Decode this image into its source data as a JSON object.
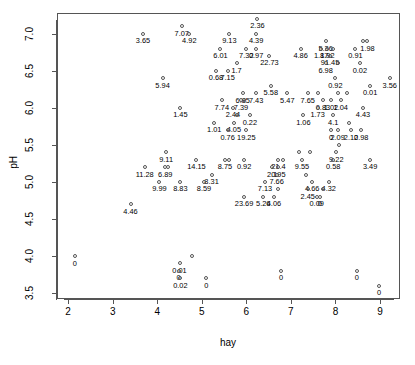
{
  "chart_data": {
    "type": "scatter",
    "title": "",
    "xlabel": "hay",
    "ylabel": "pH",
    "xlim": [
      1.75,
      9.45
    ],
    "ylim": [
      3.42,
      7.28
    ],
    "xticks": [
      "2",
      "3",
      "4",
      "5",
      "6",
      "7",
      "8",
      "9"
    ],
    "xtick_values": [
      2,
      3,
      4,
      5,
      6,
      7,
      8,
      9
    ],
    "yticks": [
      "3.5",
      "4.0",
      "4.5",
      "5.0",
      "5.5",
      "6.0",
      "6.5",
      "7.0"
    ],
    "ytick_values": [
      3.5,
      4.0,
      4.5,
      5.0,
      5.5,
      6.0,
      6.5,
      7.0
    ],
    "grid": false,
    "legend": null,
    "point_marker": "open-circle",
    "label_position": "below-point",
    "points": [
      {
        "x": 6.25,
        "y": 7.2,
        "label": "2.36"
      },
      {
        "x": 4.55,
        "y": 7.1,
        "label": "7.07"
      },
      {
        "x": 3.68,
        "y": 7.0,
        "label": "3.65"
      },
      {
        "x": 4.72,
        "y": 7.0,
        "label": "4.92"
      },
      {
        "x": 5.62,
        "y": 7.0,
        "label": "9.13"
      },
      {
        "x": 6.22,
        "y": 7.0,
        "label": "4.39"
      },
      {
        "x": 7.78,
        "y": 6.9,
        "label": "5.36"
      },
      {
        "x": 8.72,
        "y": 6.9,
        "label": "1.98"
      },
      {
        "x": 8.62,
        "y": 6.9,
        "label": ""
      },
      {
        "x": 5.42,
        "y": 6.8,
        "label": "6.01"
      },
      {
        "x": 6.0,
        "y": 6.8,
        "label": "7.32"
      },
      {
        "x": 6.22,
        "y": 6.8,
        "label": "0.97"
      },
      {
        "x": 7.22,
        "y": 6.8,
        "label": "4.86"
      },
      {
        "x": 7.68,
        "y": 6.8,
        "label": "1.87"
      },
      {
        "x": 7.82,
        "y": 6.8,
        "label": "1.92"
      },
      {
        "x": 7.95,
        "y": 6.8,
        "label": ""
      },
      {
        "x": 8.45,
        "y": 6.8,
        "label": "0.91"
      },
      {
        "x": 6.52,
        "y": 6.7,
        "label": "22.73"
      },
      {
        "x": 7.88,
        "y": 6.7,
        "label": "91.45"
      },
      {
        "x": 5.78,
        "y": 6.6,
        "label": "1.7"
      },
      {
        "x": 7.78,
        "y": 6.6,
        "label": "6.98"
      },
      {
        "x": 8.05,
        "y": 6.6,
        "label": ""
      },
      {
        "x": 8.55,
        "y": 6.6,
        "label": "0.02"
      },
      {
        "x": 5.32,
        "y": 6.5,
        "label": "0.68"
      },
      {
        "x": 5.58,
        "y": 6.5,
        "label": "7.15"
      },
      {
        "x": 4.12,
        "y": 6.4,
        "label": "5.94"
      },
      {
        "x": 8.0,
        "y": 6.4,
        "label": "0.92"
      },
      {
        "x": 9.22,
        "y": 6.4,
        "label": "3.56"
      },
      {
        "x": 6.55,
        "y": 6.3,
        "label": "5.58"
      },
      {
        "x": 8.78,
        "y": 6.3,
        "label": "0.01"
      },
      {
        "x": 5.92,
        "y": 6.2,
        "label": "6.85"
      },
      {
        "x": 6.22,
        "y": 6.2,
        "label": "7.43"
      },
      {
        "x": 6.92,
        "y": 6.2,
        "label": "5.47"
      },
      {
        "x": 7.38,
        "y": 6.2,
        "label": "7.65"
      },
      {
        "x": 7.62,
        "y": 6.2,
        "label": ""
      },
      {
        "x": 8.05,
        "y": 6.2,
        "label": ""
      },
      {
        "x": 8.25,
        "y": 6.2,
        "label": ""
      },
      {
        "x": 5.45,
        "y": 6.1,
        "label": "7.74"
      },
      {
        "x": 5.88,
        "y": 6.1,
        "label": "7.39"
      },
      {
        "x": 5.95,
        "y": 6.1,
        "label": ""
      },
      {
        "x": 7.72,
        "y": 6.1,
        "label": "0.83"
      },
      {
        "x": 7.9,
        "y": 6.1,
        "label": "1.02"
      },
      {
        "x": 8.12,
        "y": 6.1,
        "label": "1.04"
      },
      {
        "x": 4.52,
        "y": 6.0,
        "label": "1.45"
      },
      {
        "x": 5.7,
        "y": 6.0,
        "label": "2.44"
      },
      {
        "x": 7.6,
        "y": 6.0,
        "label": "1.73"
      },
      {
        "x": 8.62,
        "y": 6.0,
        "label": "4.43"
      },
      {
        "x": 5.78,
        "y": 5.9,
        "label": ""
      },
      {
        "x": 6.08,
        "y": 5.9,
        "label": "0.22"
      },
      {
        "x": 7.28,
        "y": 5.9,
        "label": "1.06"
      },
      {
        "x": 7.95,
        "y": 5.9,
        "label": "4.1"
      },
      {
        "x": 5.28,
        "y": 5.8,
        "label": "1.01"
      },
      {
        "x": 5.72,
        "y": 5.8,
        "label": "4.05"
      },
      {
        "x": 8.3,
        "y": 5.8,
        "label": ""
      },
      {
        "x": 5.58,
        "y": 5.7,
        "label": "0.76"
      },
      {
        "x": 6.0,
        "y": 5.7,
        "label": "19.25"
      },
      {
        "x": 7.9,
        "y": 5.7,
        "label": "0"
      },
      {
        "x": 8.05,
        "y": 5.7,
        "label": "2.09"
      },
      {
        "x": 8.35,
        "y": 5.7,
        "label": "2.10"
      },
      {
        "x": 8.58,
        "y": 5.7,
        "label": "2.98"
      },
      {
        "x": 8.08,
        "y": 5.5,
        "label": ""
      },
      {
        "x": 4.2,
        "y": 5.4,
        "label": "9.11"
      },
      {
        "x": 7.18,
        "y": 5.4,
        "label": ""
      },
      {
        "x": 7.42,
        "y": 5.4,
        "label": ""
      },
      {
        "x": 8.02,
        "y": 5.4,
        "label": "9.22"
      },
      {
        "x": 4.88,
        "y": 5.3,
        "label": "14.15"
      },
      {
        "x": 5.52,
        "y": 5.3,
        "label": "8.75"
      },
      {
        "x": 5.62,
        "y": 5.3,
        "label": ""
      },
      {
        "x": 5.95,
        "y": 5.3,
        "label": "0.92"
      },
      {
        "x": 6.72,
        "y": 5.3,
        "label": "21.4"
      },
      {
        "x": 6.82,
        "y": 5.3,
        "label": ""
      },
      {
        "x": 7.25,
        "y": 5.3,
        "label": "9.55"
      },
      {
        "x": 7.95,
        "y": 5.3,
        "label": "0.58"
      },
      {
        "x": 8.78,
        "y": 5.3,
        "label": "3.49"
      },
      {
        "x": 3.72,
        "y": 5.2,
        "label": "11.28"
      },
      {
        "x": 4.18,
        "y": 5.2,
        "label": "6.89"
      },
      {
        "x": 4.25,
        "y": 5.2,
        "label": ""
      },
      {
        "x": 6.58,
        "y": 5.2,
        "label": "2.1"
      },
      {
        "x": 6.72,
        "y": 5.2,
        "label": "0.95"
      },
      {
        "x": 5.22,
        "y": 5.1,
        "label": "8.31"
      },
      {
        "x": 6.68,
        "y": 5.1,
        "label": "7.66"
      },
      {
        "x": 7.35,
        "y": 5.1,
        "label": ""
      },
      {
        "x": 4.05,
        "y": 5.0,
        "label": "9.99"
      },
      {
        "x": 4.52,
        "y": 5.0,
        "label": "8.83"
      },
      {
        "x": 5.05,
        "y": 5.0,
        "label": "8.59"
      },
      {
        "x": 6.42,
        "y": 5.0,
        "label": "7.13"
      },
      {
        "x": 7.48,
        "y": 5.0,
        "label": "4.66"
      },
      {
        "x": 7.85,
        "y": 5.0,
        "label": "4.32"
      },
      {
        "x": 6.72,
        "y": 4.9,
        "label": ""
      },
      {
        "x": 7.38,
        "y": 4.9,
        "label": "2.45"
      },
      {
        "x": 7.72,
        "y": 4.9,
        "label": ""
      },
      {
        "x": 5.95,
        "y": 4.8,
        "label": "23.69"
      },
      {
        "x": 6.38,
        "y": 4.8,
        "label": "5.26"
      },
      {
        "x": 6.62,
        "y": 4.8,
        "label": "4.06"
      },
      {
        "x": 7.58,
        "y": 4.8,
        "label": "0.09"
      },
      {
        "x": 7.65,
        "y": 4.8,
        "label": "0"
      },
      {
        "x": 3.4,
        "y": 4.7,
        "label": "4.46"
      },
      {
        "x": 2.15,
        "y": 4.0,
        "label": "0"
      },
      {
        "x": 4.78,
        "y": 4.0,
        "label": ""
      },
      {
        "x": 4.5,
        "y": 3.9,
        "label": "0.01"
      },
      {
        "x": 4.48,
        "y": 3.8,
        "label": "0"
      },
      {
        "x": 6.78,
        "y": 3.8,
        "label": "0"
      },
      {
        "x": 8.48,
        "y": 3.8,
        "label": "0"
      },
      {
        "x": 4.52,
        "y": 3.7,
        "label": "0.02"
      },
      {
        "x": 5.1,
        "y": 3.7,
        "label": "0"
      },
      {
        "x": 8.98,
        "y": 3.6,
        "label": "0"
      }
    ]
  },
  "colors": {
    "axis": "#555555",
    "point_stroke": "#555555",
    "text": "#000000",
    "background": "#ffffff"
  }
}
